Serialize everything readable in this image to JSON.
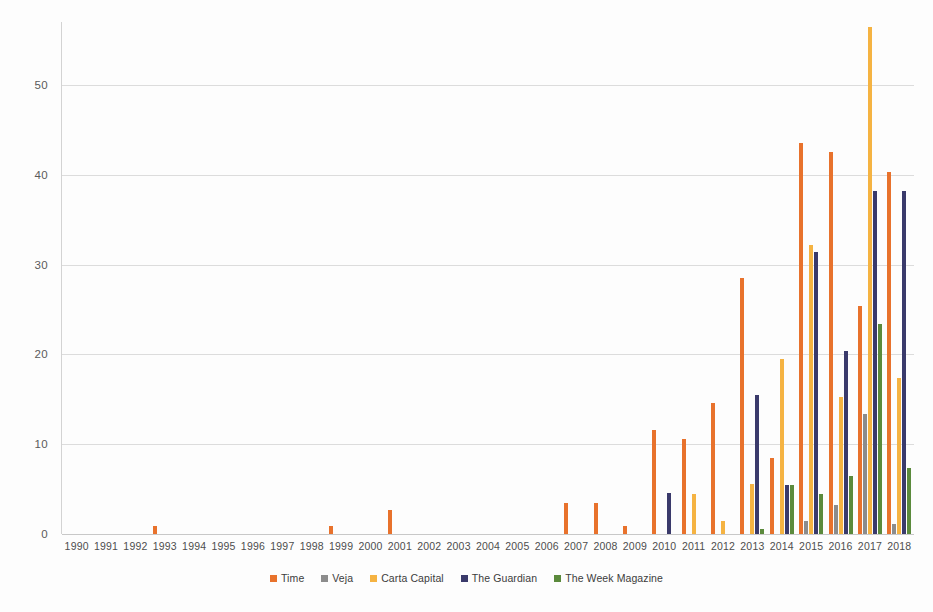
{
  "chart_data": {
    "type": "bar",
    "title": "",
    "subtitle": "",
    "xlabel": "",
    "ylabel": "",
    "ylim": [
      0,
      57
    ],
    "yticks": [
      0,
      10,
      20,
      30,
      40,
      50
    ],
    "grid": true,
    "legend_position": "bottom",
    "categories": [
      "1990",
      "1991",
      "1992",
      "1993",
      "1994",
      "1995",
      "1996",
      "1997",
      "1998",
      "1999",
      "2000",
      "2001",
      "2002",
      "2003",
      "2004",
      "2005",
      "2006",
      "2007",
      "2008",
      "2009",
      "2010",
      "2011",
      "2012",
      "2013",
      "2014",
      "2015",
      "2016",
      "2017",
      "2018"
    ],
    "series": [
      {
        "name": "Time",
        "color": "#E8722C",
        "values": [
          0,
          0,
          0,
          0.9,
          0,
          0,
          0,
          0,
          0,
          0.9,
          0,
          2.7,
          0,
          0,
          0,
          0,
          0,
          3.5,
          3.5,
          0.9,
          11.6,
          10.6,
          14.6,
          28.5,
          8.5,
          43.5,
          42.5,
          25.4,
          40.3
        ]
      },
      {
        "name": "Veja",
        "color": "#8C8C8C",
        "values": [
          0,
          0,
          0,
          0,
          0,
          0,
          0,
          0,
          0,
          0,
          0,
          0,
          0,
          0,
          0,
          0,
          0,
          0,
          0,
          0,
          0,
          0,
          0,
          0,
          0,
          1.5,
          3.2,
          13.4,
          1.1
        ]
      },
      {
        "name": "Carta Capital",
        "color": "#F5B342",
        "values": [
          0,
          0,
          0,
          0,
          0,
          0,
          0,
          0,
          0,
          0,
          0,
          0,
          0,
          0,
          0,
          0,
          0,
          0,
          0,
          0,
          0,
          4.5,
          1.4,
          5.6,
          19.5,
          32.2,
          15.3,
          56.5,
          17.4
        ]
      },
      {
        "name": "The Guardian",
        "color": "#3A3A6B",
        "values": [
          0,
          0,
          0,
          0,
          0,
          0,
          0,
          0,
          0,
          0,
          0,
          0,
          0,
          0,
          0,
          0,
          0,
          0,
          0,
          0,
          4.6,
          0,
          0,
          15.5,
          5.5,
          31.4,
          20.4,
          38.2,
          38.2
        ]
      },
      {
        "name": "The Week Magazine",
        "color": "#5B8A3C",
        "values": [
          0,
          0,
          0,
          0,
          0,
          0,
          0,
          0,
          0,
          0,
          0,
          0,
          0,
          0,
          0,
          0,
          0,
          0,
          0,
          0,
          0,
          0,
          0,
          0.6,
          5.5,
          4.4,
          6.5,
          23.4,
          7.3
        ]
      }
    ]
  },
  "axis": {
    "y_tick_labels": [
      "0",
      "10",
      "20",
      "30",
      "40",
      "50"
    ],
    "x_tick_labels": [
      "1990",
      "1991",
      "1992",
      "1993",
      "1994",
      "1995",
      "1996",
      "1997",
      "1998",
      "1999",
      "2000",
      "2001",
      "2002",
      "2003",
      "2004",
      "2005",
      "2006",
      "2007",
      "2008",
      "2009",
      "2010",
      "2011",
      "2012",
      "2013",
      "2014",
      "2015",
      "2016",
      "2017",
      "2018"
    ]
  },
  "legend": {
    "items": [
      {
        "label": "Time",
        "color": "#E8722C"
      },
      {
        "label": "Veja",
        "color": "#8C8C8C"
      },
      {
        "label": "Carta Capital",
        "color": "#F5B342"
      },
      {
        "label": "The Guardian",
        "color": "#3A3A6B"
      },
      {
        "label": "The Week Magazine",
        "color": "#5B8A3C"
      }
    ]
  },
  "colors": {
    "background": "#fdfdfd",
    "gridline": "#dcdcdc",
    "axis_line": "#d3d3d3",
    "tick_text": "#5a5a5a"
  }
}
